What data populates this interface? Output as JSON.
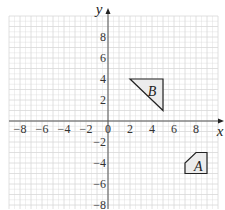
{
  "diagram": {
    "type": "coordinate-grid",
    "axes": {
      "x_label": "x",
      "y_label": "y",
      "x_ticks": [
        {
          "v": -8,
          "t": "−8"
        },
        {
          "v": -6,
          "t": "−6"
        },
        {
          "v": -4,
          "t": "−4"
        },
        {
          "v": -2,
          "t": "−2"
        },
        {
          "v": 0,
          "t": "0"
        },
        {
          "v": 2,
          "t": "2"
        },
        {
          "v": 4,
          "t": "4"
        },
        {
          "v": 6,
          "t": "6"
        },
        {
          "v": 8,
          "t": "8"
        }
      ],
      "y_ticks": [
        {
          "v": 8,
          "t": "8"
        },
        {
          "v": 6,
          "t": "6"
        },
        {
          "v": 4,
          "t": "4"
        },
        {
          "v": 2,
          "t": "2"
        },
        {
          "v": -2,
          "t": "−2"
        },
        {
          "v": -4,
          "t": "−4"
        },
        {
          "v": -6,
          "t": "−6"
        },
        {
          "v": -8,
          "t": "−8"
        }
      ],
      "x_range": [
        -9,
        10
      ],
      "y_range": [
        -8,
        10
      ]
    },
    "shapes": [
      {
        "name": "A",
        "label": "A",
        "vertices": [
          [
            7,
            -5
          ],
          [
            9,
            -5
          ],
          [
            9,
            -3
          ],
          [
            8,
            -3
          ],
          [
            7,
            -4
          ]
        ],
        "label_pos": [
          8.2,
          -4.3
        ]
      },
      {
        "name": "B",
        "label": "B",
        "vertices": [
          [
            2,
            4
          ],
          [
            5,
            4
          ],
          [
            5,
            1
          ]
        ],
        "label_pos": [
          4.0,
          2.9
        ]
      }
    ],
    "colors": {
      "grid": "#d8d8d8",
      "axis": "#555555",
      "shape_fill": "#ececec",
      "shape_stroke": "#222222"
    }
  }
}
